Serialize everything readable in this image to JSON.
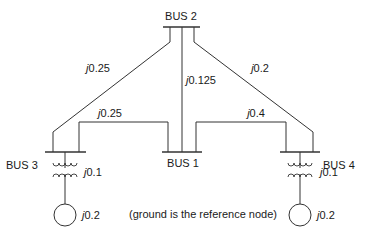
{
  "buses": {
    "bus1": {
      "label": "BUS 1"
    },
    "bus2": {
      "label": "BUS 2"
    },
    "bus3": {
      "label": "BUS 3"
    },
    "bus4": {
      "label": "BUS 4"
    }
  },
  "lines": {
    "bus2_bus3": {
      "impedance": "j0.25"
    },
    "bus2_bus1": {
      "impedance": "j0.125"
    },
    "bus2_bus4": {
      "impedance": "j0.2"
    },
    "bus3_bus1": {
      "impedance": "j0.25"
    },
    "bus1_bus4": {
      "impedance": "j0.4"
    }
  },
  "transformers": {
    "bus3": {
      "impedance": "j0.1"
    },
    "bus4": {
      "impedance": "j0.1"
    }
  },
  "generators": {
    "bus3": {
      "impedance": "j0.2"
    },
    "bus4": {
      "impedance": "j0.2"
    }
  },
  "note": "(ground is the reference node)",
  "colors": {
    "line": "#333333",
    "text": "#1a1a1a",
    "background": "#ffffff"
  }
}
